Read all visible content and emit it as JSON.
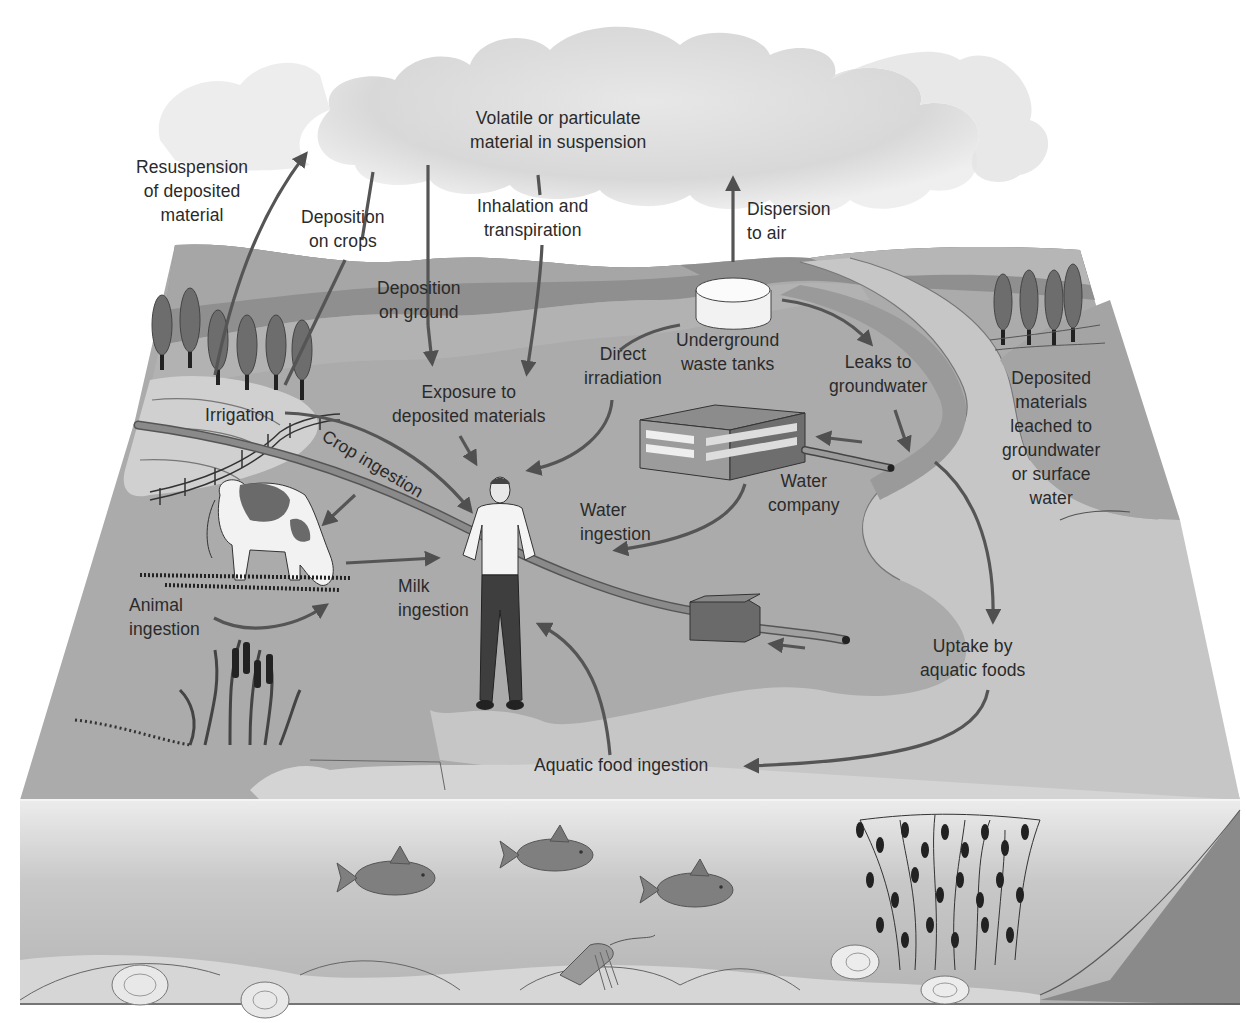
{
  "diagram": {
    "type": "environmental exposure pathways",
    "colors": {
      "background": "#ffffff",
      "cloud": "#d9d9d9",
      "land_top": "#a9a9a9",
      "hills_far": "#8f8f8f",
      "land_mid": "#b5b5b5",
      "water_surface": "#cfcfcf",
      "front_face": "#c4c4c4",
      "side_face": "#8c8c8c",
      "arrow": "#555555",
      "text": "#2a2a2a"
    },
    "labels": {
      "cloud": "Volatile or particulate\nmaterial in suspension",
      "resuspension": "Resuspension\nof deposited\nmaterial",
      "deposition_crops": "Deposition\non crops",
      "inhalation": "Inhalation and\ntranspiration",
      "dispersion": "Dispersion\nto air",
      "deposition_ground": "Deposition\non ground",
      "underground_tanks": "Underground\nwaste tanks",
      "direct_irradiation": "Direct\nirradiation",
      "leaks": "Leaks to\ngroundwater",
      "leached": "Deposited\nmaterials\nleached to\ngroundwater\nor surface\nwater",
      "exposure": "Exposure to\ndeposited materials",
      "irrigation": "Irrigation",
      "crop_ingestion": "Crop ingestion",
      "water_company": "Water\ncompany",
      "water_ingestion": "Water\ningestion",
      "milk_ingestion": "Milk\ningestion",
      "animal_ingestion": "Animal\ningestion",
      "uptake": "Uptake by\naquatic foods",
      "aquatic_food_ingestion": "Aquatic food ingestion"
    },
    "elements": {
      "cloud": "suspended-material-cloud",
      "tank": "underground-waste-tank",
      "building": "water-company-building",
      "person": "exposed-person",
      "cow": "grazing-cow",
      "fish_count": 3,
      "trees_left_count": 6,
      "trees_right_count": 4
    }
  }
}
